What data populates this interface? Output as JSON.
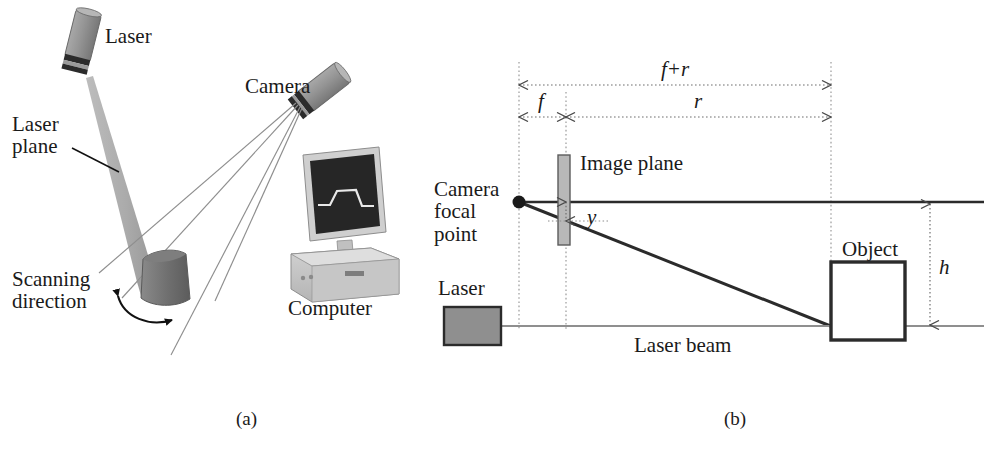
{
  "figure": {
    "caption_a": "(a)",
    "caption_b": "(b)"
  },
  "panel_a": {
    "name": "laser-scanning-setup",
    "labels": {
      "laser": "Laser",
      "laser_plane": "Laser\nplane",
      "camera": "Camera",
      "computer": "Computer",
      "scanning_direction": "Scanning\ndirection"
    },
    "colors": {
      "device_body": "#8f8f8f",
      "device_band": "#2b2b2b",
      "laser_sheet": "#b0b0b0",
      "object_dome": "#6e6e6e",
      "monitor_screen": "#262626",
      "computer_case": "#c4c4c4",
      "ray_line": "#8a8a8a"
    }
  },
  "panel_b": {
    "name": "triangulation-geometry",
    "labels": {
      "camera_focal_point": "Camera\nfocal\npoint",
      "image_plane": "Image plane",
      "object": "Object",
      "laser": "Laser",
      "laser_beam": "Laser beam"
    },
    "dimensions": {
      "f_plus_r": "f+r",
      "f": "f",
      "r": "r",
      "y": "y",
      "h": "h"
    },
    "colors": {
      "solid_line": "#2b2b2b",
      "dotted_line": "#8c8c8c",
      "image_plane_fill": "#b8b8b8",
      "laser_block_fill": "#8f8f8f",
      "beam_line": "#8f8f8f"
    }
  },
  "geometry": {
    "focal_point": {
      "x": 519,
      "y": 202
    },
    "image_plane_x": 566,
    "object_left_x": 831,
    "optical_axis_y": 202,
    "laser_beam_y": 326,
    "object_box": {
      "x": 831,
      "y": 262,
      "w": 74,
      "h": 78
    }
  }
}
